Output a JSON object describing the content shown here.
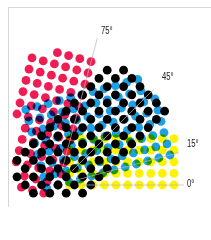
{
  "diagram": {
    "origin": [
      58,
      185
    ],
    "spacing": 11.6,
    "dot_radius": 4.4,
    "screens": [
      {
        "name": "yellow",
        "angle": 0,
        "color": "#fff200",
        "label": "0°",
        "label_pos": [
          187,
          177
        ],
        "line_len": 126,
        "cols": [
          1,
          11
        ],
        "rows": [
          0,
          4
        ]
      },
      {
        "name": "cyan",
        "angle": 15,
        "color": "#1ea0e6",
        "label": "15°",
        "label_pos": [
          187,
          137
        ],
        "line_len": 125,
        "cols": [
          -1,
          10
        ],
        "rows": [
          0,
          7
        ]
      },
      {
        "name": "black",
        "angle": 45,
        "color": "#000000",
        "label": "45°",
        "label_pos": [
          162,
          70
        ],
        "line_len": 136,
        "cols": [
          -2,
          11
        ],
        "rows": [
          -2,
          4
        ]
      },
      {
        "name": "magenta",
        "angle": 75,
        "color": "#ee1e55",
        "label": "75°",
        "label_pos": [
          101,
          24
        ],
        "line_len": 152,
        "cols": [
          -1,
          12
        ],
        "rows": [
          0,
          5
        ]
      }
    ]
  }
}
